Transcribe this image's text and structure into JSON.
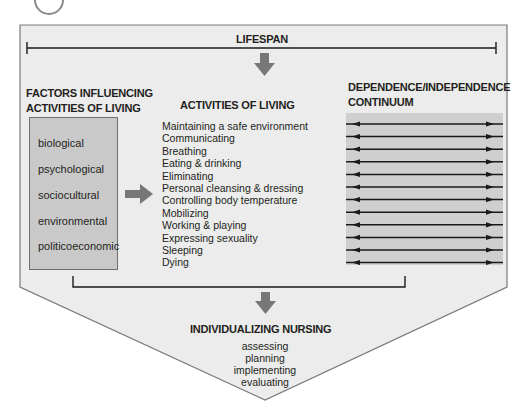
{
  "header": {
    "circle_badge": ""
  },
  "lifespan": {
    "label": "LIFESPAN"
  },
  "factors": {
    "heading_line1": "FACTORS INFLUENCING",
    "heading_line2": "ACTIVITIES OF LIVING",
    "items": [
      "biological",
      "psychological",
      "sociocultural",
      "environmental",
      "politicoeconomic"
    ]
  },
  "activities": {
    "heading": "ACTIVITIES OF LIVING",
    "items": [
      "Maintaining a safe environment",
      "Communicating",
      "Breathing",
      "Eating & drinking",
      "Eliminating",
      "Personal cleansing & dressing",
      "Controlling body temperature",
      "Mobilizing",
      "Working & playing",
      "Expressing sexuality",
      "Sleeping",
      "Dying"
    ]
  },
  "continuum": {
    "heading_line1": "DEPENDENCE/INDEPENDENCE",
    "heading_line2": "CONTINUUM",
    "row_count": 12
  },
  "nursing": {
    "heading": "INDIVIDUALIZING NURSING",
    "steps": [
      "assessing",
      "planning",
      "implementing",
      "evaluating"
    ]
  },
  "colors": {
    "outer_fill": "#ececec",
    "outline": "#7a7a7a",
    "box_fill": "#c9c9c9",
    "continuum_fill": "#cfcfcf",
    "arrow_fill": "#777777",
    "text": "#231f20"
  }
}
